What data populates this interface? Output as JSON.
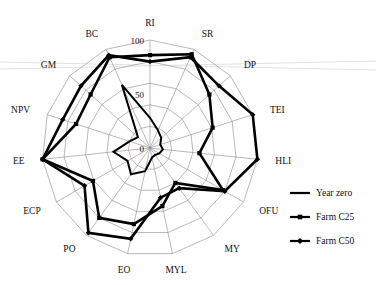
{
  "figure": {
    "background": "#ffffff",
    "line_color": "#000000",
    "grid_color": "#8a8a8a"
  },
  "legend": {
    "position": "right",
    "items": [
      {
        "label": "Year zero",
        "marker": "none",
        "style": "line"
      },
      {
        "label": "Farm C25",
        "marker": "square",
        "style": "line-marker"
      },
      {
        "label": "Farm C50",
        "marker": "diamond",
        "style": "line-marker"
      }
    ]
  },
  "chart_data": {
    "type": "radar",
    "title": "",
    "subtitle": "",
    "xlabel": "",
    "ylabel": "",
    "grid": true,
    "rings": 5,
    "rlim": [
      0,
      100
    ],
    "radial_ticks": [
      0,
      50,
      100
    ],
    "radial_tick_labels": [
      "0",
      "50",
      "100"
    ],
    "legend_position": "right",
    "categories": [
      "RI",
      "SR",
      "DP",
      "TEI",
      "HLI",
      "OFU",
      "MY",
      "MYL",
      "EO",
      "PO",
      "ECP",
      "EE",
      "NPV",
      "GM",
      "BC"
    ],
    "series": [
      {
        "name": "Year zero",
        "marker": "none",
        "values": [
          28,
          18,
          14,
          10,
          12,
          10,
          8,
          9,
          22,
          30,
          24,
          34,
          20,
          15,
          64
        ]
      },
      {
        "name": "Farm C25",
        "marker": "square",
        "values": [
          86,
          95,
          74,
          61,
          46,
          78,
          40,
          55,
          72,
          80,
          61,
          100,
          72,
          74,
          92
        ]
      },
      {
        "name": "Farm C50",
        "marker": "diamond",
        "values": [
          80,
          92,
          86,
          100,
          100,
          80,
          46,
          47,
          86,
          97,
          70,
          100,
          85,
          86,
          94
        ]
      }
    ]
  }
}
